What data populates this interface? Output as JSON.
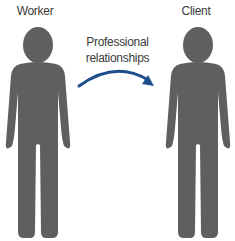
{
  "labels": {
    "worker": "Worker",
    "client": "Client",
    "relationship_line1": "Professional",
    "relationship_line2": "relationships"
  },
  "colors": {
    "figure": "#5f5f61",
    "arrow": "#1f4f8b",
    "text": "#3a3a3a",
    "background": "#ffffff"
  },
  "figures": [
    {
      "name": "worker",
      "icon": "person-silhouette-icon"
    },
    {
      "name": "client",
      "icon": "person-silhouette-icon"
    }
  ],
  "arrow": {
    "direction": "worker-to-client",
    "icon": "curved-arrow-icon"
  }
}
